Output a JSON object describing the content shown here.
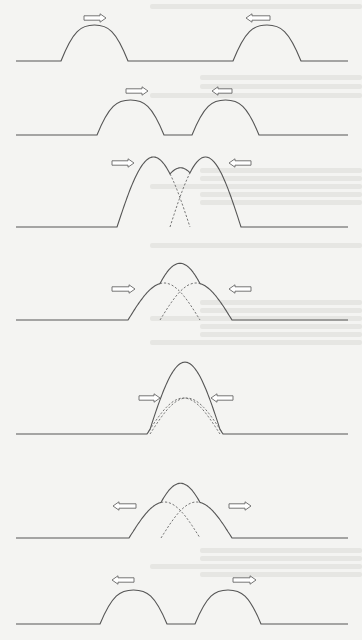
{
  "figure": {
    "topic": "superposition of two wave pulses",
    "colors": {
      "background": "#f4f4f2",
      "line": "#555555",
      "dashed": "#666666",
      "arrow_stroke": "#666666",
      "arrow_fill": "#ffffff",
      "bleed_through": "#e6e6e3"
    },
    "stages": [
      {
        "index": 1,
        "description": "two separate pulses approaching each other",
        "baseline_y": 61,
        "pulses": [
          {
            "x0": 61,
            "x1": 128,
            "peak_y": 25,
            "style": "solid"
          },
          {
            "x0": 233,
            "x1": 301,
            "peak_y": 25,
            "style": "solid"
          }
        ],
        "arrows": [
          {
            "x0": 84,
            "x1": 106,
            "y": 18,
            "direction": "right"
          },
          {
            "x0": 246,
            "x1": 270,
            "y": 18,
            "direction": "left"
          }
        ]
      },
      {
        "index": 2,
        "description": "pulses closer together",
        "baseline_y": 135,
        "pulses": [
          {
            "x0": 97,
            "x1": 164,
            "peak_y": 100,
            "style": "solid"
          },
          {
            "x0": 192,
            "x1": 259,
            "peak_y": 100,
            "style": "solid"
          }
        ],
        "arrows": [
          {
            "x0": 126,
            "x1": 148,
            "y": 91,
            "direction": "right"
          },
          {
            "x0": 212,
            "x1": 232,
            "y": 91,
            "direction": "left"
          }
        ]
      },
      {
        "index": 3,
        "description": "pulses begin to overlap, small central bump",
        "baseline_y": 227,
        "pulses": [
          {
            "x0": 117,
            "x1": 190,
            "peak_y": 157,
            "style": "dashed-overlap"
          },
          {
            "x0": 170,
            "x1": 241,
            "peak_y": 157,
            "style": "dashed-overlap"
          }
        ],
        "resultant_peak": {
          "x": 180,
          "y": 155
        },
        "arrows": [
          {
            "x0": 112,
            "x1": 134,
            "y": 163,
            "direction": "right"
          },
          {
            "x0": 229,
            "x1": 251,
            "y": 163,
            "direction": "left"
          }
        ]
      },
      {
        "index": 4,
        "description": "greater overlap, taller central peak",
        "baseline_y": 320,
        "pulses": [
          {
            "x0": 128,
            "x1": 200,
            "peak_y": 283,
            "style": "dashed-overlap"
          },
          {
            "x0": 160,
            "x1": 232,
            "peak_y": 283,
            "style": "dashed-overlap"
          }
        ],
        "resultant_peak": {
          "x": 180,
          "y": 261
        },
        "arrows": [
          {
            "x0": 112,
            "x1": 135,
            "y": 289,
            "direction": "right"
          },
          {
            "x0": 229,
            "x1": 251,
            "y": 289,
            "direction": "left"
          }
        ]
      },
      {
        "index": 5,
        "description": "complete overlap, resultant pulse twice the height",
        "baseline_y": 434,
        "pulses": [
          {
            "x0": 147,
            "x1": 220,
            "peak_y": 398,
            "style": "dashed"
          },
          {
            "x0": 150,
            "x1": 223,
            "peak_y": 398,
            "style": "dashed"
          }
        ],
        "resultant_peak": {
          "x": 181,
          "y": 362
        },
        "arrows": [
          {
            "x0": 139,
            "x1": 160,
            "y": 398,
            "direction": "right"
          },
          {
            "x0": 211,
            "x1": 233,
            "y": 398,
            "direction": "left"
          }
        ]
      },
      {
        "index": 6,
        "description": "pulses separating, overlap decreasing",
        "baseline_y": 538,
        "pulses": [
          {
            "x0": 129,
            "x1": 200,
            "peak_y": 502,
            "style": "dashed-overlap"
          },
          {
            "x0": 161,
            "x1": 232,
            "peak_y": 502,
            "style": "dashed-overlap"
          }
        ],
        "resultant_peak": {
          "x": 180,
          "y": 481
        },
        "arrows": [
          {
            "x0": 113,
            "x1": 136,
            "y": 506,
            "direction": "left"
          },
          {
            "x0": 229,
            "x1": 251,
            "y": 506,
            "direction": "right"
          }
        ]
      },
      {
        "index": 7,
        "description": "pulses fully separated, moving apart unchanged",
        "baseline_y": 624,
        "pulses": [
          {
            "x0": 100,
            "x1": 167,
            "peak_y": 590,
            "style": "solid"
          },
          {
            "x0": 195,
            "x1": 261,
            "peak_y": 590,
            "style": "solid"
          }
        ],
        "arrows": [
          {
            "x0": 112,
            "x1": 134,
            "y": 580,
            "direction": "left"
          },
          {
            "x0": 233,
            "x1": 256,
            "y": 580,
            "direction": "right"
          }
        ]
      }
    ],
    "line_x_range": [
      16,
      348
    ]
  }
}
